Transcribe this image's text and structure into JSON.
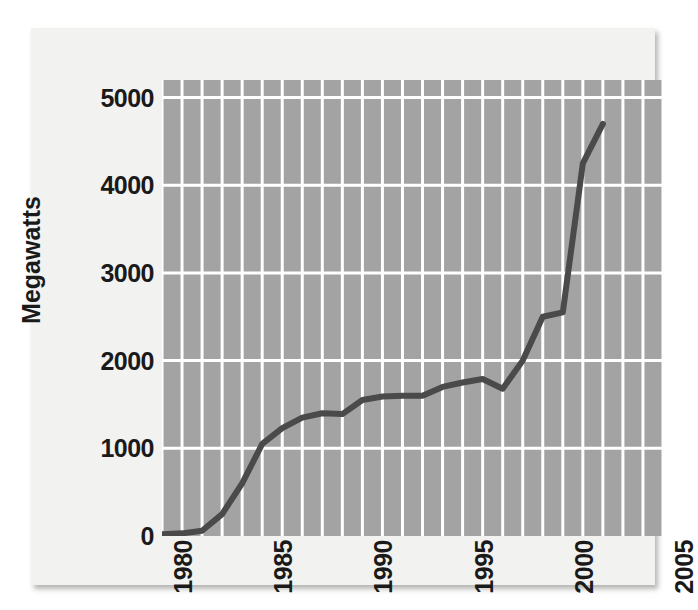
{
  "figure": {
    "panel_background": "#f2f2f0",
    "plot_background": "#a3a3a3",
    "gridline_color": "#ffffff",
    "line_color": "#4a4a4a",
    "text_color": "#1a1a1a"
  },
  "chart_data": {
    "type": "line",
    "title": "",
    "xlabel": "",
    "ylabel": "Megawatts",
    "xlim": [
      1980,
      2005
    ],
    "ylim": [
      0,
      5200
    ],
    "ytick_labels": [
      "5000",
      "4000",
      "3000",
      "2000",
      "1000",
      "0"
    ],
    "ytick_values": [
      5000,
      4000,
      3000,
      2000,
      1000,
      0
    ],
    "xtick_labels": [
      "1980",
      "1985",
      "1990",
      "1995",
      "2000",
      "2005"
    ],
    "xtick_values": [
      1980,
      1985,
      1990,
      1995,
      2000,
      2005
    ],
    "grid": true,
    "grid_minor_x": true,
    "legend": "none",
    "series": [
      {
        "name": "Installed capacity",
        "x": [
          1980,
          1981,
          1982,
          1983,
          1984,
          1985,
          1986,
          1987,
          1988,
          1989,
          1990,
          1991,
          1992,
          1993,
          1994,
          1995,
          1996,
          1997,
          1998,
          1999,
          2000,
          2001,
          2002
        ],
        "values": [
          20,
          30,
          60,
          250,
          600,
          1050,
          1230,
          1350,
          1400,
          1390,
          1550,
          1590,
          1600,
          1600,
          1700,
          1750,
          1790,
          1680,
          2000,
          2500,
          2550,
          4250,
          4700
        ]
      }
    ]
  }
}
